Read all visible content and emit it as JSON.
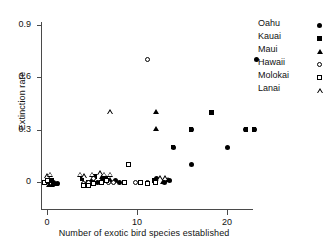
{
  "chart_data": {
    "type": "scatter",
    "title": "",
    "xlabel": "Number of exotic bird species established",
    "ylabel": "Extinction rate",
    "xlim": [
      -1.5,
      25
    ],
    "ylim": [
      -0.06,
      0.95
    ],
    "xticks": [
      0,
      10,
      20
    ],
    "xticklabels": [
      "0",
      "10",
      "20"
    ],
    "yticks": [
      0,
      0.3,
      0.6,
      0.9
    ],
    "yticklabels": [
      "0",
      "0.3",
      "0.6",
      "0.9"
    ],
    "grid": false,
    "legend_position": "upper right",
    "series": [
      {
        "name": "Oahu",
        "marker": "filled-circle",
        "color": "#000000",
        "points": [
          [
            0.7,
            0.0
          ],
          [
            1.2,
            -0.01
          ],
          [
            5.0,
            0.01
          ],
          [
            5.6,
            0.0
          ],
          [
            6.2,
            0.02
          ],
          [
            7.6,
            0.01
          ],
          [
            8.1,
            0.0
          ],
          [
            8.6,
            0.0
          ],
          [
            12.2,
            0.02
          ],
          [
            13.0,
            0.0
          ],
          [
            13.6,
            0.01
          ],
          [
            14.0,
            0.2
          ],
          [
            16.0,
            0.1
          ],
          [
            16.0,
            0.3
          ],
          [
            20.0,
            0.2
          ],
          [
            22.1,
            0.3
          ],
          [
            23.0,
            0.3
          ],
          [
            23.3,
            0.7
          ]
        ]
      },
      {
        "name": "Kauai",
        "marker": "filled-square",
        "color": "#000000",
        "points": [
          [
            0.1,
            0.0
          ],
          [
            0.5,
            0.01
          ],
          [
            3.9,
            0.02
          ],
          [
            4.6,
            0.0
          ],
          [
            5.3,
            0.03
          ],
          [
            6.0,
            0.0
          ],
          [
            6.5,
            0.02
          ],
          [
            11.9,
            0.01
          ],
          [
            14.0,
            0.2
          ],
          [
            16.0,
            0.3
          ],
          [
            18.3,
            0.4
          ],
          [
            22.1,
            0.3
          ],
          [
            23.0,
            0.3
          ]
        ]
      },
      {
        "name": "Maui",
        "marker": "filled-triangle",
        "color": "#000000",
        "points": [
          [
            0.2,
            -0.02
          ],
          [
            0.6,
            -0.02
          ],
          [
            1.0,
            -0.01
          ],
          [
            4.4,
            -0.01
          ],
          [
            5.1,
            0.0
          ],
          [
            6.1,
            0.03
          ],
          [
            6.6,
            0.02
          ],
          [
            7.0,
            0.01
          ],
          [
            12.1,
            0.3
          ],
          [
            12.1,
            0.4
          ],
          [
            12.9,
            0.0
          ],
          [
            13.5,
            0.01
          ]
        ]
      },
      {
        "name": "Hawaii",
        "marker": "open-circle",
        "color": "#000000",
        "points": [
          [
            4.0,
            -0.01
          ],
          [
            4.6,
            0.0
          ],
          [
            5.2,
            0.02
          ],
          [
            6.8,
            0.0
          ],
          [
            7.4,
            0.0
          ],
          [
            9.8,
            0.0
          ],
          [
            11.2,
            0.0
          ],
          [
            11.2,
            0.7
          ]
        ]
      },
      {
        "name": "Molokai",
        "marker": "open-square",
        "color": "#000000",
        "points": [
          [
            -0.3,
            0.0
          ],
          [
            0.1,
            0.01
          ],
          [
            4.0,
            -0.02
          ],
          [
            4.6,
            -0.02
          ],
          [
            5.2,
            -0.01
          ],
          [
            6.0,
            0.0
          ],
          [
            6.6,
            0.01
          ],
          [
            8.6,
            0.0
          ],
          [
            9.1,
            0.1
          ],
          [
            10.4,
            0.0
          ],
          [
            11.2,
            -0.01
          ],
          [
            12.0,
            0.0
          ]
        ]
      },
      {
        "name": "Lanai",
        "marker": "open-triangle",
        "color": "#000000",
        "points": [
          [
            0.0,
            0.03
          ],
          [
            0.4,
            0.04
          ],
          [
            3.7,
            0.04
          ],
          [
            4.2,
            0.03
          ],
          [
            5.0,
            0.04
          ],
          [
            5.9,
            0.05
          ],
          [
            6.4,
            0.04
          ],
          [
            7.0,
            0.4
          ],
          [
            7.0,
            0.04
          ],
          [
            12.6,
            0.02
          ],
          [
            13.2,
            0.02
          ]
        ]
      }
    ]
  },
  "legend": {
    "entries": [
      {
        "label": "Oahu",
        "marker": "filled-circle"
      },
      {
        "label": "Kauai",
        "marker": "filled-square"
      },
      {
        "label": "Maui",
        "marker": "filled-triangle"
      },
      {
        "label": "Hawaii",
        "marker": "open-circle"
      },
      {
        "label": "Molokai",
        "marker": "open-square"
      },
      {
        "label": "Lanai",
        "marker": "open-triangle"
      }
    ]
  }
}
